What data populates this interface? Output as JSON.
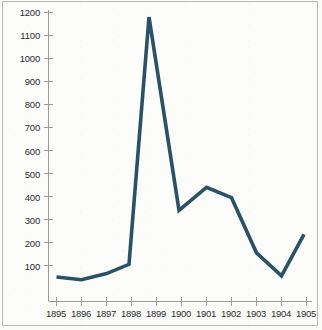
{
  "chart_data": {
    "type": "line",
    "title": "",
    "subtitle": "",
    "xlabel": "",
    "ylabel": "",
    "grid": false,
    "legend": false,
    "legend_position": "none",
    "line_color": "#2a5266",
    "background_color": "#fcfcfb",
    "axis_color": "#9a9a98",
    "tick_label_color": "#2c2c2c",
    "xlim": [
      1895,
      1905
    ],
    "ylim": [
      0,
      1200
    ],
    "ytick_values": [
      100,
      200,
      300,
      400,
      500,
      600,
      700,
      800,
      900,
      1000,
      1100,
      1200
    ],
    "ytick_labels": [
      "100",
      "200",
      "300",
      "400",
      "500",
      "600",
      "700",
      "800",
      "900",
      "1000",
      "1100",
      "1200"
    ],
    "xtick_values": [
      1895,
      1896,
      1897,
      1898,
      1899,
      1900,
      1901,
      1902,
      1903,
      1904,
      1905
    ],
    "xtick_labels": [
      "1895",
      "1896",
      "1897",
      "1898",
      "1899",
      "1900",
      "1901",
      "1902",
      "1903",
      "1904",
      "1905"
    ],
    "categories": [
      "1895",
      "1896",
      "1897",
      "1898",
      "1899",
      "1900",
      "1901",
      "1902",
      "1903",
      "1904",
      "1905"
    ],
    "values": [
      50,
      38,
      65,
      105,
      1180,
      340,
      440,
      395,
      155,
      55,
      235
    ],
    "series": [
      {
        "name": "series-1",
        "color": "#2a5266",
        "points": [
          {
            "x": 1895.0,
            "y": 50
          },
          {
            "x": 1896.0,
            "y": 38
          },
          {
            "x": 1897.0,
            "y": 65
          },
          {
            "x": 1897.9,
            "y": 105
          },
          {
            "x": 1898.7,
            "y": 1180
          },
          {
            "x": 1899.9,
            "y": 340
          },
          {
            "x": 1901.0,
            "y": 440
          },
          {
            "x": 1902.0,
            "y": 395
          },
          {
            "x": 1903.0,
            "y": 155
          },
          {
            "x": 1904.0,
            "y": 55
          },
          {
            "x": 1904.9,
            "y": 235
          }
        ]
      }
    ],
    "annotations": []
  }
}
